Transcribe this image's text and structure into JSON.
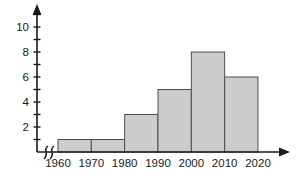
{
  "figure": {
    "colors": {
      "background": "#ffffff",
      "bar_fill": "#cccccc",
      "bar_border": "#4d4d4d",
      "axis": "#1a1a1a",
      "text": "#1a1a1a"
    }
  },
  "chart_data": {
    "type": "bar",
    "subtype": "histogram",
    "title": "",
    "xlabel": "",
    "ylabel": "",
    "bin_edges": [
      1960,
      1970,
      1980,
      1990,
      2000,
      2010,
      2020
    ],
    "categories": [
      "1960-1970",
      "1970-1980",
      "1980-1990",
      "1990-2000",
      "2000-2010",
      "2010-2020"
    ],
    "values": [
      1,
      1,
      3,
      5,
      8,
      6
    ],
    "x_tick_labels": [
      "1960",
      "1970",
      "1980",
      "1990",
      "2000",
      "2010",
      "2020"
    ],
    "y_tick_labels": [
      2,
      4,
      6,
      8,
      10
    ],
    "y_minor_ticks": [
      1,
      3,
      5,
      7,
      9,
      11
    ],
    "ylim": [
      0,
      11
    ],
    "grid": false,
    "legend": false,
    "axis_arrows": true,
    "x_axis_break_near_origin": true
  }
}
